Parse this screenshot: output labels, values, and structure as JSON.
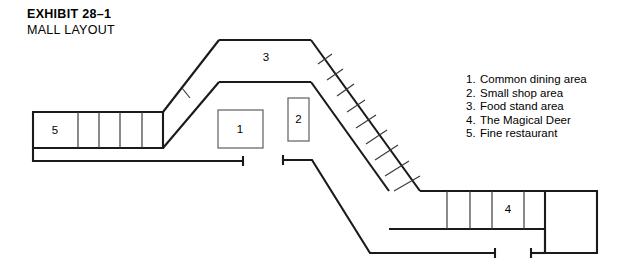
{
  "exhibit": {
    "title": "EXHIBIT  28–1",
    "subtitle": "MALL LAYOUT"
  },
  "legend": {
    "items": [
      {
        "num": "1.",
        "label": "Common dining area"
      },
      {
        "num": "2.",
        "label": "Small shop area"
      },
      {
        "num": "3.",
        "label": "Food stand area"
      },
      {
        "num": "4.",
        "label": "The Magical Deer"
      },
      {
        "num": "5.",
        "label": "Fine restaurant"
      }
    ]
  },
  "plan": {
    "labels": {
      "left_wing": "5",
      "center_square": "1",
      "center_tall": "2",
      "top_corridor": "3",
      "lower_right_wing": "4"
    },
    "colors": {
      "wall": "#1a1a1a",
      "room_outline": "#6a6b6f",
      "divider": "#3a3b3f",
      "background": "#ffffff",
      "text": "#000000"
    }
  }
}
